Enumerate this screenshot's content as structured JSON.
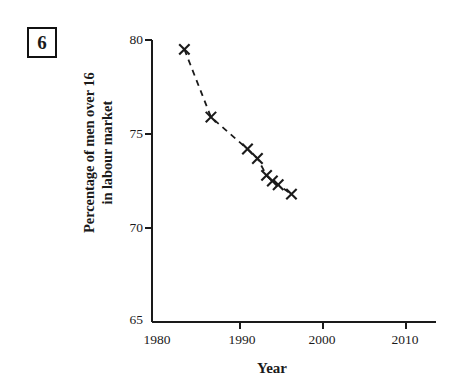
{
  "question": {
    "number": "6"
  },
  "chart_data": {
    "type": "line",
    "title": "",
    "subtitle": "",
    "xlabel": "Year",
    "ylabel": "Percentage of men over 16\nin labour market",
    "xlim": [
      1980,
      2013
    ],
    "ylim": [
      65,
      80
    ],
    "xticks": [
      "1980",
      "1990",
      "2000",
      "2010"
    ],
    "xtick_values": [
      1980,
      1990,
      2000,
      2010
    ],
    "yticks": [
      "65",
      "70",
      "75",
      "80"
    ],
    "ytick_values": [
      65,
      70,
      75,
      80
    ],
    "grid": false,
    "legend": null,
    "marker": "x",
    "linestyle": "dashed",
    "series": [
      {
        "name": "Percentage of men over 16 in labour market",
        "x": [
          1983.3,
          1986.5,
          1990.9,
          1992.1,
          1993.2,
          1993.9,
          1994.6,
          1996.2
        ],
        "values": [
          79.5,
          75.9,
          74.2,
          73.7,
          72.8,
          72.5,
          72.3,
          71.8
        ]
      }
    ],
    "annotations": [],
    "colors": {
      "line": "#1a1a1a",
      "marker": "#1a1a1a",
      "axis": "#1a1a1a",
      "background": "#ffffff"
    }
  }
}
